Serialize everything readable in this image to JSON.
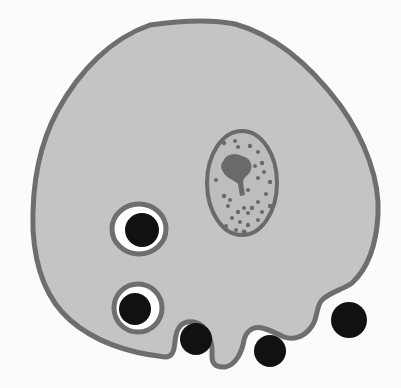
{
  "diagram": {
    "colors": {
      "background": "#fbfbfb",
      "cytoplasm": "#c4c4c4",
      "membrane": "#6e6e6e",
      "nucleus_fill": "#bdbdbd",
      "chromatin": "#6a6a6a",
      "vacuole_space": "#ffffff",
      "particle": "#111111"
    },
    "elements": {
      "cell": "cell-body",
      "nucleus": "nucleus",
      "vacuoles": [
        "food-vacuole-1",
        "food-vacuole-2"
      ],
      "particles_outside": 2,
      "particles_engulfing": 1
    }
  }
}
